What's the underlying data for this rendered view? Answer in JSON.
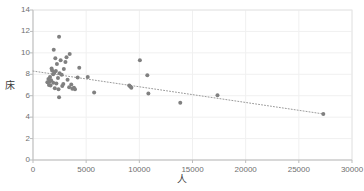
{
  "chart_data": {
    "type": "scatter",
    "title": "",
    "xlabel": "人",
    "ylabel": "床",
    "xlim": [
      0,
      30000
    ],
    "ylim": [
      0,
      14
    ],
    "xticks": [
      0,
      5000,
      10000,
      15000,
      20000,
      25000,
      30000
    ],
    "xtick_labels": [
      "0",
      "5000",
      "10000",
      "15000",
      "20000",
      "25000",
      "30000"
    ],
    "yticks": [
      0,
      2,
      4,
      6,
      8,
      10,
      12,
      14
    ],
    "ytick_labels": [
      "0",
      "2",
      "4",
      "6",
      "8",
      "10",
      "12",
      "14"
    ],
    "grid": true,
    "grid_color": "#f0f0f0",
    "legend": false,
    "marker_color": "#808080",
    "marker_size": 4,
    "series": [
      {
        "name": "data",
        "points": [
          [
            2450,
            11.5
          ],
          [
            1950,
            10.3
          ],
          [
            3450,
            9.9
          ],
          [
            3150,
            9.6
          ],
          [
            2100,
            9.5
          ],
          [
            2600,
            9.3
          ],
          [
            10050,
            9.3
          ],
          [
            3050,
            9.15
          ],
          [
            2250,
            8.95
          ],
          [
            4350,
            8.6
          ],
          [
            1750,
            8.55
          ],
          [
            2900,
            8.5
          ],
          [
            1800,
            8.35
          ],
          [
            2150,
            8.3
          ],
          [
            10750,
            7.9
          ],
          [
            2000,
            8.15
          ],
          [
            1900,
            8.0
          ],
          [
            2500,
            8.1
          ],
          [
            2700,
            7.95
          ],
          [
            1600,
            7.75
          ],
          [
            4200,
            7.7
          ],
          [
            5150,
            7.75
          ],
          [
            2350,
            7.65
          ],
          [
            1450,
            7.55
          ],
          [
            3250,
            7.5
          ],
          [
            1700,
            7.45
          ],
          [
            1550,
            7.3
          ],
          [
            1350,
            7.25
          ],
          [
            1900,
            7.2
          ],
          [
            2200,
            7.15
          ],
          [
            2850,
            7.1
          ],
          [
            3600,
            7.05
          ],
          [
            1500,
            7.0
          ],
          [
            1650,
            6.95
          ],
          [
            2750,
            6.9
          ],
          [
            9050,
            6.95
          ],
          [
            9150,
            6.85
          ],
          [
            9250,
            6.75
          ],
          [
            3400,
            6.8
          ],
          [
            3850,
            6.75
          ],
          [
            2050,
            6.7
          ],
          [
            3700,
            6.65
          ],
          [
            2400,
            6.6
          ],
          [
            3950,
            6.6
          ],
          [
            5750,
            6.3
          ],
          [
            10850,
            6.2
          ],
          [
            17350,
            6.05
          ],
          [
            2450,
            5.85
          ],
          [
            13850,
            5.35
          ],
          [
            27300,
            4.3
          ]
        ]
      }
    ],
    "trendline": {
      "type": "linear-dotted",
      "color": "#9a9a9a",
      "x_start": 0,
      "y_start": 8.3,
      "x_end": 27300,
      "y_end": 4.3
    }
  },
  "plot_area": {
    "left": 33,
    "top": 10,
    "right": 352,
    "bottom": 160
  }
}
